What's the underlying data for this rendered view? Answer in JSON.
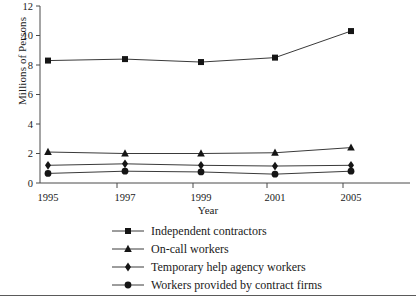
{
  "chart_data": {
    "type": "line",
    "title": "",
    "xlabel": "Year",
    "ylabel": "Millions of Persons",
    "categories": [
      "1995",
      "1997",
      "1999",
      "2001",
      "2005"
    ],
    "x_tick_labels": [
      "1995",
      "1997",
      "1999",
      "2001",
      "2005"
    ],
    "y_tick_labels": [
      "0",
      "2",
      "4",
      "6",
      "8",
      "10",
      "12"
    ],
    "y_ticks": [
      0,
      2,
      4,
      6,
      8,
      10,
      12
    ],
    "ylim": [
      0,
      12
    ],
    "grid": false,
    "legend_position": "below",
    "series": [
      {
        "name": "Independent contractors",
        "marker": "square",
        "color": "#151515",
        "values": [
          8.3,
          8.4,
          8.2,
          8.5,
          10.3
        ]
      },
      {
        "name": "On-call workers",
        "marker": "triangle",
        "color": "#151515",
        "values": [
          2.1,
          2.0,
          2.0,
          2.05,
          2.4
        ]
      },
      {
        "name": "Temporary help agency workers",
        "marker": "diamond",
        "color": "#151515",
        "values": [
          1.2,
          1.3,
          1.2,
          1.15,
          1.2
        ]
      },
      {
        "name": "Workers provided by contract firms",
        "marker": "circle",
        "color": "#151515",
        "values": [
          0.65,
          0.8,
          0.75,
          0.6,
          0.8
        ]
      }
    ]
  },
  "legend": {
    "items": [
      {
        "label": "Independent contractors",
        "marker": "square"
      },
      {
        "label": "On-call workers",
        "marker": "triangle"
      },
      {
        "label": "Temporary help agency workers",
        "marker": "diamond"
      },
      {
        "label": "Workers provided by contract firms",
        "marker": "circle"
      }
    ]
  },
  "colors": {
    "axis": "#4a4a4a",
    "line": "#3a3a3a",
    "marker": "#151515",
    "text": "#1a1a1a",
    "background": "#ffffff"
  }
}
